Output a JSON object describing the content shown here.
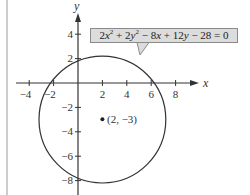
{
  "figure": {
    "x_axis_label": "x",
    "y_axis_label": "y",
    "x_ticks": [
      {
        "value": -4,
        "label": "−4"
      },
      {
        "value": -2,
        "label": "−2"
      },
      {
        "value": 2,
        "label": "2"
      },
      {
        "value": 4,
        "label": "4"
      },
      {
        "value": 6,
        "label": "6"
      },
      {
        "value": 8,
        "label": "8"
      }
    ],
    "y_ticks": [
      {
        "value": 4,
        "label": "4"
      },
      {
        "value": 2,
        "label": "2"
      },
      {
        "value": -2,
        "label": "−2"
      },
      {
        "value": -4,
        "label": "−4"
      },
      {
        "value": -6,
        "label": "−6"
      },
      {
        "value": -8,
        "label": "−8"
      }
    ],
    "equation": {
      "t1": "2",
      "v1": "x",
      "e1": "2",
      "t2": " + 2",
      "v2": "y",
      "e2": "2",
      "t3": " − 8",
      "v3": "x",
      "t4": " + 12",
      "v4": "y",
      "t5": " − 28 = 0"
    },
    "center_label": "(2, −3)",
    "circle": {
      "cx": 2,
      "cy": -3,
      "r": 5.196
    },
    "colors": {
      "line": "#333333",
      "box_fill": "#dcdcdc",
      "box_border": "#8a8a8a",
      "frame": "#9a9a9a"
    }
  }
}
